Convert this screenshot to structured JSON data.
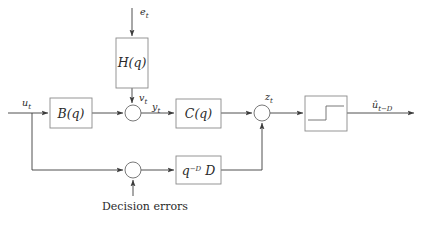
{
  "diagram": {
    "background_color": "#ffffff",
    "line_color": "#3c3c3c",
    "box_stroke_color": "#8a8a8a",
    "text_color": "#2a2a2a",
    "blocks": [
      {
        "id": "H",
        "label": "H(q)",
        "label_main": "H",
        "label_arg": "(q)",
        "x": 116,
        "y": 38,
        "w": 32,
        "h": 50
      },
      {
        "id": "B",
        "label": "B(q)",
        "label_main": "B",
        "label_arg": "(q)",
        "x": 50,
        "y": 98,
        "w": 42,
        "h": 30
      },
      {
        "id": "C",
        "label": "C(q)",
        "label_main": "C",
        "label_arg": "(q)",
        "x": 176,
        "y": 99,
        "w": 45,
        "h": 29
      },
      {
        "id": "Q",
        "label": "quantizer",
        "label_main": "",
        "label_arg": "",
        "x": 305,
        "y": 96,
        "w": 42,
        "h": 35
      },
      {
        "id": "D",
        "label": "q^-D D",
        "label_main": "q",
        "label_exp": "−D",
        "label_arg": "D",
        "x": 176,
        "y": 156,
        "w": 45,
        "h": 28
      }
    ],
    "summing_junctions": [
      {
        "id": "sum1",
        "cx": 133,
        "cy": 113,
        "r": 8
      },
      {
        "id": "sum2",
        "cx": 262,
        "cy": 113,
        "r": 8
      },
      {
        "id": "sum3",
        "cx": 133,
        "cy": 170,
        "r": 8
      }
    ],
    "signals": {
      "input_e": {
        "base": "e",
        "sub": "t",
        "x": 143,
        "y": 14
      },
      "input_u": {
        "base": "u",
        "sub": "t",
        "x": 26,
        "y": 103
      },
      "noise_v": {
        "base": "v",
        "sub": "t",
        "x": 142,
        "y": 99
      },
      "mid_y": {
        "base": "y",
        "sub": "t",
        "x": 156,
        "y": 110
      },
      "pre_decision_z": {
        "base": "z",
        "sub": "t",
        "x": 268,
        "y": 99
      },
      "output_u_hat": {
        "base": "û",
        "sub": "t−D",
        "x": 378,
        "y": 108
      }
    },
    "annotations": [
      {
        "id": "decision-errors",
        "text": "Decision errors",
        "x": 145,
        "y": 209
      }
    ]
  }
}
